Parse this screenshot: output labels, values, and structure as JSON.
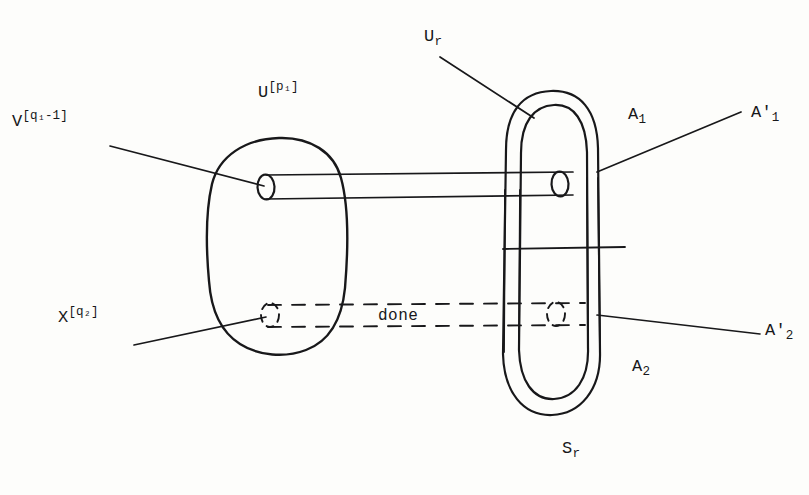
{
  "figure": {
    "kind": "hand-drawn mathematical topology diagram",
    "background_color": "#fdfdfb",
    "ink_color": "#18181a",
    "width": 809,
    "height": 495
  },
  "labels": {
    "v_base": "V",
    "v_sup": "[q₁-1]",
    "u_base": "U",
    "u_sup": "[p₁]",
    "x_base": "X",
    "x_sup": "[q₂]",
    "ur_base": "U",
    "ur_sub": "r",
    "a1": "A",
    "a1_sub": "1",
    "a1p_base": "A",
    "a1p_prime": "'",
    "a1p_sub": "1",
    "a2": "A",
    "a2_sub": "2",
    "a2p_base": "A",
    "a2p_prime": "'",
    "a2p_sub": "2",
    "sr_base": "S",
    "sr_sub": "r",
    "done": "done"
  },
  "shapes": {
    "left_blob": "rounded closed curve (oval) centered near (278,250)",
    "right_capsule": "stadium / capsule outline with inner parallel capsule near (565,255)",
    "tube": "horizontal cylinder joining left blob to right capsule",
    "dashed_track": "two horizontal dashed lines between the two dashed circles"
  }
}
